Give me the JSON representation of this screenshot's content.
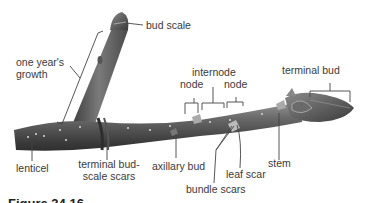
{
  "diagram": {
    "labels": {
      "bud_scale": "bud scale",
      "one_years_growth_line1": "one year's",
      "one_years_growth_line2": "growth",
      "internode": "internode",
      "node_left": "node",
      "node_right": "node",
      "terminal_bud": "terminal bud",
      "lenticel": "lenticel",
      "terminal_bud_scale_scars_line1": "terminal bud-",
      "terminal_bud_scale_scars_line2": "scale scars",
      "axillary_bud": "axillary bud",
      "leaf_scar": "leaf scar",
      "stem": "stem",
      "bundle_scars": "bundle scars"
    },
    "caption": "Figure 34.16"
  },
  "colors": {
    "stem_dark": "#4a4a4a",
    "stem_light": "#8c8c8c",
    "leader_line": "#444444",
    "background": "#ffffff"
  }
}
